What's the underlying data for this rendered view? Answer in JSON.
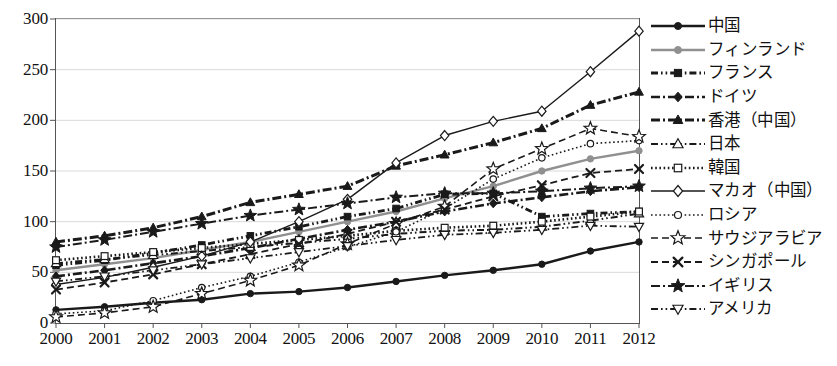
{
  "chart_data": {
    "type": "line",
    "title": "",
    "subtitle": "",
    "xlabel": "",
    "ylabel": "",
    "grid": true,
    "legend_position": "right",
    "x": [
      "2000",
      "2001",
      "2002",
      "2003",
      "2004",
      "2005",
      "2006",
      "2007",
      "2008",
      "2009",
      "2010",
      "2011",
      "2012"
    ],
    "xlim": [
      2000,
      2012
    ],
    "ylim": [
      0,
      300
    ],
    "ytick_labels": [
      "0",
      "50",
      "100",
      "150",
      "200",
      "250",
      "300"
    ],
    "ytick_values": [
      0,
      50,
      100,
      150,
      200,
      250,
      300
    ],
    "xtick_labels": [
      "2000",
      "2001",
      "2002",
      "2003",
      "2004",
      "2005",
      "2006",
      "2007",
      "2008",
      "2009",
      "2010",
      "2011",
      "2012"
    ],
    "series": [
      {
        "name": "中国",
        "marker": "filled-circle",
        "dash": "solid",
        "color": "#1a1a1a",
        "width": 2.4,
        "values": [
          13,
          16,
          20,
          23,
          29,
          31,
          35,
          41,
          47,
          52,
          58,
          71,
          80
        ]
      },
      {
        "name": "フィンランド",
        "marker": "filled-circle",
        "dash": "solid",
        "color": "#909090",
        "width": 2.4,
        "values": [
          52,
          58,
          64,
          72,
          80,
          90,
          100,
          110,
          123,
          135,
          150,
          162,
          170
        ]
      },
      {
        "name": "フランス",
        "marker": "filled-square",
        "dash": "dash-dot-dot",
        "color": "#1a1a1a",
        "width": 2.8,
        "values": [
          57,
          62,
          69,
          77,
          86,
          95,
          105,
          113,
          127,
          128,
          105,
          108,
          110
        ]
      },
      {
        "name": "ドイツ",
        "marker": "filled-diamond",
        "dash": "dash-dot",
        "color": "#1a1a1a",
        "width": 2.6,
        "values": [
          46,
          52,
          59,
          66,
          74,
          83,
          92,
          100,
          110,
          118,
          124,
          130,
          134
        ]
      },
      {
        "name": "香港（中国）",
        "marker": "filled-triangle",
        "dash": "dash-dot",
        "color": "#1a1a1a",
        "width": 3.0,
        "values": [
          80,
          86,
          94,
          105,
          119,
          127,
          135,
          155,
          166,
          178,
          192,
          215,
          228
        ]
      },
      {
        "name": "日本",
        "marker": "open-triangle",
        "dash": "dash-dot-dot",
        "color": "#1a1a1a",
        "width": 2.0,
        "values": [
          59,
          63,
          67,
          71,
          75,
          79,
          83,
          88,
          91,
          92,
          95,
          101,
          108
        ]
      },
      {
        "name": "韓国",
        "marker": "open-square",
        "dash": "dotted",
        "color": "#1a1a1a",
        "width": 2.6,
        "values": [
          62,
          66,
          70,
          74,
          78,
          82,
          86,
          91,
          94,
          96,
          100,
          105,
          110
        ]
      },
      {
        "name": "マカオ（中国）",
        "marker": "open-diamond",
        "dash": "solid",
        "color": "#1a1a1a",
        "width": 1.4,
        "values": [
          38,
          45,
          55,
          66,
          80,
          100,
          122,
          158,
          185,
          199,
          209,
          248,
          288
        ]
      },
      {
        "name": "ロシア",
        "marker": "open-circle",
        "dash": "dotted",
        "color": "#1a1a1a",
        "width": 1.6,
        "values": [
          9,
          12,
          22,
          35,
          46,
          60,
          75,
          90,
          113,
          142,
          163,
          177,
          180
        ]
      },
      {
        "name": "サウジアラビア",
        "marker": "open-star",
        "dash": "dashed",
        "color": "#1a1a1a",
        "width": 1.6,
        "values": [
          6,
          10,
          16,
          29,
          42,
          57,
          78,
          98,
          115,
          152,
          172,
          192,
          184
        ]
      },
      {
        "name": "シンガポール",
        "marker": "cross-x",
        "dash": "dashed",
        "color": "#1a1a1a",
        "width": 1.8,
        "values": [
          33,
          40,
          48,
          58,
          68,
          78,
          88,
          100,
          112,
          125,
          136,
          148,
          152
        ]
      },
      {
        "name": "イギリス",
        "marker": "filled-star",
        "dash": "dash-dot",
        "color": "#1a1a1a",
        "width": 2.0,
        "values": [
          75,
          82,
          90,
          98,
          106,
          112,
          118,
          124,
          128,
          128,
          130,
          133,
          135
        ]
      },
      {
        "name": "アメリカ",
        "marker": "open-down-triangle",
        "dash": "dash-dot-dot",
        "color": "#1a1a1a",
        "width": 1.8,
        "values": [
          41,
          46,
          52,
          58,
          64,
          70,
          76,
          82,
          87,
          89,
          92,
          96,
          95
        ]
      }
    ]
  },
  "axes": {
    "frame_color": "#555555",
    "grid_color": "#d9d9d9"
  }
}
